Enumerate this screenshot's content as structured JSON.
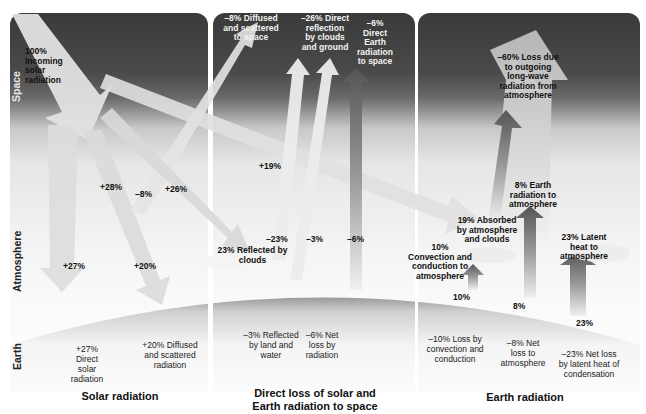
{
  "diagram": {
    "layers": {
      "space": "Space",
      "atmosphere": "Atmosphere",
      "earth": "Earth"
    },
    "panels": [
      {
        "title": "Solar radiation",
        "incoming": "100% Incoming solar radiation",
        "arrow_labels": {
          "direct_atm": "+27%",
          "to_atm_28": "+28%",
          "diffused_space": "–8%",
          "to_clouds_26": "+26%",
          "diffused_ground": "+20%",
          "long_19": "+19%"
        },
        "earth_labels": {
          "direct": "+27% Direct solar radiation",
          "diffused": "+20% Diffused and scattered radiation"
        }
      },
      {
        "title": "Direct loss of solar and Earth radiation to space",
        "space_labels": {
          "diffused": "–8% Diffused and scattered to space",
          "reflection": "–26% Direct reflection by clouds and ground",
          "earth_rad": "–6% Direct Earth radiation to space"
        },
        "arrow_labels": {
          "clouds": "–23%",
          "land": "–3%",
          "net": "–6%"
        },
        "cloud_label": "23% Reflected by clouds",
        "earth_labels": {
          "reflected": "–3% Reflected by land and water",
          "net_loss": "–6% Net loss by radiation"
        }
      },
      {
        "title": "Earth radiation",
        "space_label": "–60% Loss due to outgoing long-wave radiation from atmosphere",
        "atm_labels": {
          "absorbed": "19% Absorbed by atmosphere and clouds",
          "earth_rad": "8% Earth radiation to atmosphere",
          "convection": "10% Convection and conduction to atmosphere",
          "latent": "23% Latent heat to atmosphere"
        },
        "arrow_labels": {
          "convection": "10%",
          "earth_rad": "8%",
          "latent": "23%"
        },
        "earth_labels": {
          "convection": "–10% Loss by convection and conduction",
          "net": "–8% Net loss to atmosphere",
          "latent": "–23% Net loss by latent heat of condensation"
        }
      }
    ],
    "colors": {
      "space_dark": "#3a3a3a",
      "arrow_light": "#eeeeee",
      "arrow_dark": "#6a6a6a"
    }
  }
}
